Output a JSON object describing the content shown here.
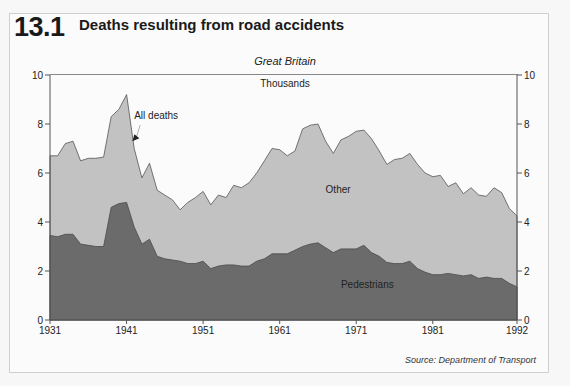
{
  "header": {
    "figure_number": "13.1",
    "title": "Deaths resulting from road accidents",
    "subtitle": "Great Britain",
    "unit_label": "Thousands"
  },
  "footer": {
    "source": "Source: Department of Transport"
  },
  "colors": {
    "pedestrians": "#6b6b6b",
    "other": "#c2c2c2",
    "outline": "#555555",
    "background": "#fbfbfb"
  },
  "chart_data": {
    "type": "area",
    "title": "Deaths resulting from road accidents",
    "subtitle": "Great Britain",
    "xlabel": "",
    "ylabel": "Thousands",
    "xlim": [
      1931,
      1992
    ],
    "ylim": [
      0,
      10
    ],
    "x_ticks": [
      1931,
      1941,
      1951,
      1961,
      1971,
      1981,
      1992
    ],
    "y_ticks": [
      0,
      2,
      4,
      6,
      8,
      10
    ],
    "grid": false,
    "stacked": true,
    "annotations": [
      {
        "text": "All deaths",
        "x": 1942,
        "y": 8.2,
        "arrow_to": [
          1941.5,
          7.3
        ]
      },
      {
        "text": "Other",
        "x": 1967,
        "y": 5.2
      },
      {
        "text": "Pedestrians",
        "x": 1969,
        "y": 1.3
      }
    ],
    "x": [
      1931,
      1932,
      1933,
      1934,
      1935,
      1936,
      1937,
      1938,
      1939,
      1940,
      1941,
      1942,
      1943,
      1944,
      1945,
      1946,
      1947,
      1948,
      1949,
      1950,
      1951,
      1952,
      1953,
      1954,
      1955,
      1956,
      1957,
      1958,
      1959,
      1960,
      1961,
      1962,
      1963,
      1964,
      1965,
      1966,
      1967,
      1968,
      1969,
      1970,
      1971,
      1972,
      1973,
      1974,
      1975,
      1976,
      1977,
      1978,
      1979,
      1980,
      1981,
      1982,
      1983,
      1984,
      1985,
      1986,
      1987,
      1988,
      1989,
      1990,
      1991,
      1992
    ],
    "series": [
      {
        "name": "All deaths",
        "values": [
          6.7,
          6.7,
          7.2,
          7.3,
          6.5,
          6.6,
          6.6,
          6.65,
          8.3,
          8.6,
          9.2,
          7.0,
          5.8,
          6.4,
          5.3,
          5.1,
          4.9,
          4.5,
          4.8,
          5.0,
          5.25,
          4.7,
          5.1,
          5.0,
          5.5,
          5.4,
          5.6,
          6.0,
          6.5,
          7.0,
          6.95,
          6.7,
          6.9,
          7.8,
          7.95,
          8.0,
          7.3,
          6.8,
          7.35,
          7.5,
          7.7,
          7.75,
          7.4,
          6.9,
          6.35,
          6.55,
          6.6,
          6.8,
          6.35,
          6.0,
          5.85,
          5.9,
          5.45,
          5.6,
          5.15,
          5.4,
          5.1,
          5.05,
          5.4,
          5.2,
          4.55,
          4.25
        ]
      },
      {
        "name": "Pedestrians",
        "values": [
          3.45,
          3.4,
          3.5,
          3.5,
          3.1,
          3.05,
          3.0,
          3.0,
          4.6,
          4.75,
          4.8,
          3.8,
          3.1,
          3.3,
          2.6,
          2.5,
          2.45,
          2.4,
          2.3,
          2.3,
          2.4,
          2.1,
          2.2,
          2.25,
          2.25,
          2.2,
          2.2,
          2.4,
          2.5,
          2.7,
          2.7,
          2.7,
          2.85,
          3.0,
          3.1,
          3.15,
          2.95,
          2.75,
          2.9,
          2.9,
          2.9,
          3.05,
          2.75,
          2.6,
          2.35,
          2.3,
          2.3,
          2.4,
          2.1,
          1.95,
          1.85,
          1.85,
          1.9,
          1.85,
          1.8,
          1.85,
          1.7,
          1.75,
          1.7,
          1.7,
          1.5,
          1.35
        ]
      }
    ]
  }
}
